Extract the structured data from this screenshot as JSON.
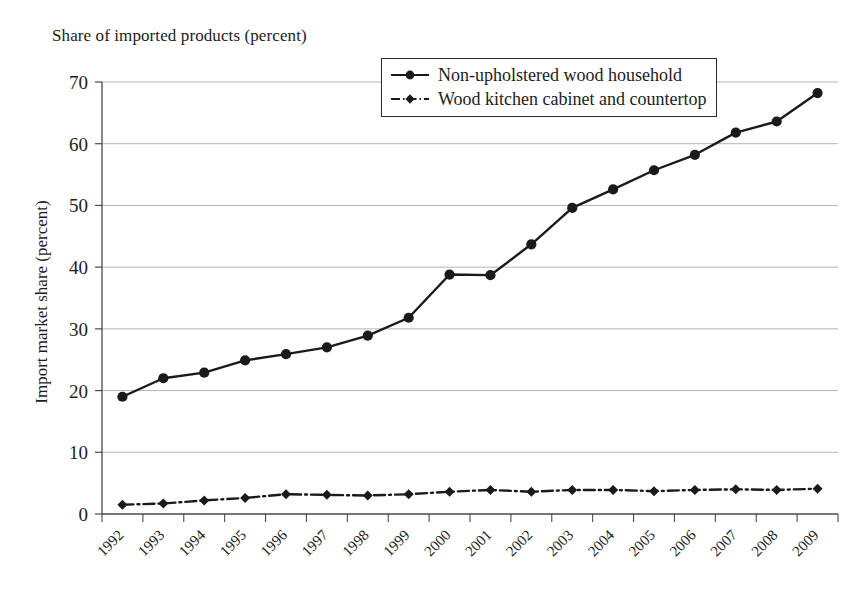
{
  "chart_data": {
    "type": "line",
    "title": "Share of imported products (percent)",
    "xlabel": "",
    "ylabel": "Import market share (percent)",
    "x": [
      1992,
      1993,
      1994,
      1995,
      1996,
      1997,
      1998,
      1999,
      2000,
      2001,
      2002,
      2003,
      2004,
      2005,
      2006,
      2007,
      2008,
      2009
    ],
    "categories": [
      "1992",
      "1993",
      "1994",
      "1995",
      "1996",
      "1997",
      "1998",
      "1999",
      "2000",
      "2001",
      "2002",
      "2003",
      "2004",
      "2005",
      "2006",
      "2007",
      "2008",
      "2009"
    ],
    "series": [
      {
        "name": "Non-upholstered wood household",
        "values": [
          19.0,
          22.0,
          22.9,
          24.9,
          25.9,
          27.0,
          28.9,
          31.8,
          38.8,
          38.7,
          43.7,
          49.6,
          52.6,
          55.7,
          58.2,
          61.8,
          63.6,
          68.2
        ],
        "line_style": "solid",
        "marker": "circle",
        "color": "#1a1a1a"
      },
      {
        "name": "Wood kitchen cabinet and countertop",
        "values": [
          1.5,
          1.7,
          2.2,
          2.6,
          3.2,
          3.1,
          3.0,
          3.2,
          3.6,
          3.9,
          3.6,
          3.9,
          3.9,
          3.7,
          3.9,
          4.0,
          3.9,
          4.1
        ],
        "line_style": "dash-dot",
        "marker": "diamond",
        "color": "#1a1a1a"
      }
    ],
    "ylim": [
      0,
      70
    ],
    "yticks": [
      0,
      10,
      20,
      30,
      40,
      50,
      60,
      70
    ],
    "ytick_labels": [
      "0",
      "10",
      "20",
      "30",
      "40",
      "50",
      "60",
      "70"
    ],
    "grid": "horizontal",
    "grid_color": "#b4b4b4",
    "legend_position": "top-center",
    "xtick_rotation": -45,
    "axis_color": "#4a4a4a",
    "background": "#ffffff"
  },
  "legend": {
    "items": [
      {
        "label": "Non-upholstered wood household",
        "marker": "circle-marker"
      },
      {
        "label": "Wood kitchen cabinet and countertop",
        "marker": "diamond-marker"
      }
    ]
  }
}
